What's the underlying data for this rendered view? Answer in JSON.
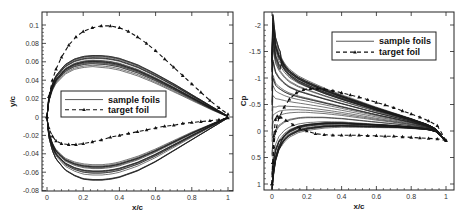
{
  "chart_data": [
    {
      "type": "line",
      "title": "",
      "xlabel": "x/c",
      "ylabel": "y/c",
      "xlim": [
        0,
        1
      ],
      "ylim": [
        -0.08,
        0.114
      ],
      "xticks": [
        "0",
        "0.2",
        "0.4",
        "0.6",
        "0.8",
        "1"
      ],
      "yticks": [
        "0.1",
        "0.08",
        "0.06",
        "0.04",
        "0.02",
        "0",
        "-0.02",
        "-0.04",
        "-0.06",
        "-0.08"
      ],
      "grid": false,
      "legend": {
        "position": "center-left",
        "entries": [
          "sample foils",
          "target foil"
        ]
      },
      "series": [
        {
          "name": "target foil (upper)",
          "style": "dashed-triangle",
          "x": [
            0,
            0.01,
            0.03,
            0.05,
            0.08,
            0.12,
            0.16,
            0.2,
            0.25,
            0.3,
            0.35,
            0.4,
            0.45,
            0.5,
            0.55,
            0.6,
            0.65,
            0.7,
            0.75,
            0.8,
            0.85,
            0.9,
            0.95,
            1.0
          ],
          "y": [
            0,
            0.022,
            0.04,
            0.052,
            0.065,
            0.078,
            0.087,
            0.093,
            0.097,
            0.099,
            0.099,
            0.097,
            0.093,
            0.087,
            0.08,
            0.072,
            0.063,
            0.054,
            0.045,
            0.036,
            0.027,
            0.018,
            0.01,
            0.003
          ]
        },
        {
          "name": "target foil (lower)",
          "style": "dashed-triangle",
          "x": [
            0,
            0.01,
            0.03,
            0.05,
            0.08,
            0.12,
            0.16,
            0.2,
            0.25,
            0.3,
            0.35,
            0.4,
            0.45,
            0.5,
            0.55,
            0.6,
            0.65,
            0.7,
            0.75,
            0.8,
            0.85,
            0.9,
            0.95,
            1.0
          ],
          "y": [
            0,
            -0.012,
            -0.021,
            -0.026,
            -0.029,
            -0.03,
            -0.03,
            -0.029,
            -0.027,
            -0.025,
            -0.022,
            -0.02,
            -0.018,
            -0.016,
            -0.014,
            -0.012,
            -0.01,
            -0.009,
            -0.007,
            -0.006,
            -0.005,
            -0.004,
            -0.003,
            -0.001
          ]
        },
        {
          "name": "sample foils (upper envelope max)",
          "style": "solid",
          "x": [
            0,
            0.01,
            0.03,
            0.05,
            0.1,
            0.15,
            0.2,
            0.25,
            0.3,
            0.35,
            0.4,
            0.5,
            0.6,
            0.7,
            0.8,
            0.9,
            1.0
          ],
          "y": [
            0,
            0.022,
            0.037,
            0.046,
            0.058,
            0.064,
            0.067,
            0.068,
            0.068,
            0.067,
            0.065,
            0.058,
            0.048,
            0.037,
            0.025,
            0.013,
            0.001
          ]
        },
        {
          "name": "sample foils (upper envelope min)",
          "style": "solid",
          "x": [
            0,
            0.01,
            0.03,
            0.05,
            0.1,
            0.15,
            0.2,
            0.25,
            0.3,
            0.35,
            0.4,
            0.5,
            0.6,
            0.7,
            0.8,
            0.9,
            1.0
          ],
          "y": [
            0,
            0.016,
            0.028,
            0.035,
            0.045,
            0.05,
            0.052,
            0.053,
            0.052,
            0.051,
            0.049,
            0.043,
            0.035,
            0.026,
            0.017,
            0.008,
            0.0
          ]
        },
        {
          "name": "sample foils (lower envelope max)",
          "style": "solid",
          "x": [
            0,
            0.01,
            0.03,
            0.05,
            0.1,
            0.15,
            0.2,
            0.25,
            0.3,
            0.35,
            0.4,
            0.5,
            0.6,
            0.7,
            0.8,
            0.9,
            1.0
          ],
          "y": [
            0,
            -0.016,
            -0.028,
            -0.035,
            -0.044,
            -0.048,
            -0.05,
            -0.051,
            -0.051,
            -0.05,
            -0.048,
            -0.042,
            -0.034,
            -0.025,
            -0.016,
            -0.008,
            0.0
          ]
        },
        {
          "name": "sample foils (lower envelope min)",
          "style": "solid",
          "x": [
            0,
            0.01,
            0.03,
            0.05,
            0.1,
            0.15,
            0.2,
            0.25,
            0.3,
            0.35,
            0.4,
            0.5,
            0.6,
            0.7,
            0.8,
            0.9,
            1.0
          ],
          "y": [
            0,
            -0.022,
            -0.037,
            -0.046,
            -0.058,
            -0.064,
            -0.068,
            -0.069,
            -0.069,
            -0.068,
            -0.066,
            -0.059,
            -0.049,
            -0.037,
            -0.025,
            -0.013,
            -0.001
          ]
        }
      ]
    },
    {
      "type": "line",
      "title": "",
      "xlabel": "x/c",
      "ylabel": "Cp",
      "xlim": [
        0,
        1
      ],
      "ylim": [
        1.1,
        -2.25
      ],
      "y_inverted": true,
      "xticks": [
        "0",
        "0.2",
        "0.4",
        "0.6",
        "0.8",
        "1"
      ],
      "yticks": [
        "-2",
        "-1.5",
        "-1",
        "-0.5",
        "0",
        "0.5",
        "1"
      ],
      "grid": false,
      "legend": {
        "position": "upper-right",
        "entries": [
          "sample foils",
          "target foil"
        ]
      },
      "series": [
        {
          "name": "target foil (upper surface)",
          "style": "dashed-triangle",
          "x": [
            0,
            0.005,
            0.01,
            0.02,
            0.04,
            0.07,
            0.1,
            0.14,
            0.18,
            0.22,
            0.26,
            0.3,
            0.35,
            0.4,
            0.45,
            0.5,
            0.55,
            0.6,
            0.65,
            0.7,
            0.75,
            0.8,
            0.85,
            0.9,
            0.95,
            1.0
          ],
          "y": [
            1.0,
            0.6,
            0.3,
            0.0,
            -0.25,
            -0.45,
            -0.6,
            -0.72,
            -0.78,
            -0.8,
            -0.8,
            -0.79,
            -0.76,
            -0.72,
            -0.68,
            -0.64,
            -0.59,
            -0.54,
            -0.49,
            -0.44,
            -0.38,
            -0.32,
            -0.26,
            -0.19,
            -0.1,
            0.18
          ]
        },
        {
          "name": "target foil (lower surface)",
          "style": "dashed-triangle",
          "x": [
            0,
            0.005,
            0.01,
            0.02,
            0.03,
            0.05,
            0.08,
            0.12,
            0.16,
            0.2,
            0.25,
            0.3,
            0.35,
            0.4,
            0.45,
            0.5,
            0.55,
            0.6,
            0.65,
            0.7,
            0.75,
            0.8,
            0.85,
            0.9,
            0.95,
            1.0
          ],
          "y": [
            1.0,
            0.6,
            0.1,
            -0.22,
            -0.28,
            -0.26,
            -0.2,
            -0.12,
            -0.05,
            0.0,
            0.05,
            0.07,
            0.08,
            0.08,
            0.08,
            0.08,
            0.09,
            0.09,
            0.1,
            0.1,
            0.11,
            0.12,
            0.13,
            0.14,
            0.15,
            0.18
          ]
        },
        {
          "name": "sample foils (suction side)",
          "style": "solid",
          "x": [
            0,
            0.005,
            0.01,
            0.02,
            0.04,
            0.07,
            0.1,
            0.15,
            0.2,
            0.3,
            0.4,
            0.5,
            0.6,
            0.7,
            0.8,
            0.9,
            0.95,
            1.0
          ],
          "y": [
            -1.3,
            -2.05,
            -1.85,
            -1.6,
            -1.4,
            -1.22,
            -1.1,
            -0.98,
            -0.9,
            -0.76,
            -0.64,
            -0.53,
            -0.42,
            -0.32,
            -0.22,
            -0.11,
            -0.02,
            0.2
          ]
        },
        {
          "name": "sample foils (pressure side)",
          "style": "solid",
          "x": [
            0,
            0.005,
            0.01,
            0.02,
            0.04,
            0.07,
            0.1,
            0.15,
            0.2,
            0.3,
            0.4,
            0.5,
            0.6,
            0.7,
            0.8,
            0.9,
            0.95,
            1.0
          ],
          "y": [
            1.0,
            0.85,
            0.7,
            0.5,
            0.3,
            0.15,
            0.06,
            -0.02,
            -0.06,
            -0.1,
            -0.11,
            -0.1,
            -0.09,
            -0.08,
            -0.06,
            -0.03,
            0.02,
            0.2
          ]
        }
      ]
    }
  ],
  "plots": [
    {
      "id": "left",
      "frame": {
        "x": 42,
        "y": 12,
        "w": 191,
        "h": 179
      },
      "map": {
        "x0": 47,
        "xs": 181,
        "y0": 117,
        "ys": -920
      },
      "xticks": [
        {
          "v": 0,
          "label": "0"
        },
        {
          "v": 0.2,
          "label": "0.2"
        },
        {
          "v": 0.4,
          "label": "0.4"
        },
        {
          "v": 0.6,
          "label": "0.6"
        },
        {
          "v": 0.8,
          "label": "0.8"
        },
        {
          "v": 1,
          "label": "1"
        }
      ],
      "yticks": [
        {
          "v": 0.1,
          "label": "0.1"
        },
        {
          "v": 0.08,
          "label": "0.08"
        },
        {
          "v": 0.06,
          "label": "0.06"
        },
        {
          "v": 0.04,
          "label": "0.04"
        },
        {
          "v": 0.02,
          "label": "0.02"
        },
        {
          "v": 0,
          "label": "0"
        },
        {
          "v": -0.02,
          "label": "-0.02"
        },
        {
          "v": -0.04,
          "label": "-0.04"
        },
        {
          "v": -0.06,
          "label": "-0.06"
        },
        {
          "v": -0.08,
          "label": "-0.08"
        }
      ],
      "xlabel": "x/c",
      "ylabel": "y/c",
      "legend": {
        "x": 61,
        "y": 91,
        "w": 105,
        "h": 26,
        "sample_label": "sample foils",
        "target_label": "target foil"
      }
    },
    {
      "id": "right",
      "frame": {
        "x": 264,
        "y": 12,
        "w": 190,
        "h": 178
      },
      "map": {
        "x0": 272,
        "xs": 174,
        "y0": 131,
        "ys": 53
      },
      "xticks": [
        {
          "v": 0,
          "label": "0"
        },
        {
          "v": 0.2,
          "label": "0.2"
        },
        {
          "v": 0.4,
          "label": "0.4"
        },
        {
          "v": 0.6,
          "label": "0.6"
        },
        {
          "v": 0.8,
          "label": "0.8"
        },
        {
          "v": 1,
          "label": "1"
        }
      ],
      "yticks": [
        {
          "v": -2,
          "label": "-2"
        },
        {
          "v": -1.5,
          "label": "-1.5"
        },
        {
          "v": -1,
          "label": "-1"
        },
        {
          "v": -0.5,
          "label": "-0.5"
        },
        {
          "v": 0,
          "label": "0"
        },
        {
          "v": 0.5,
          "label": "0.5"
        },
        {
          "v": 1,
          "label": "1"
        }
      ],
      "xlabel": "x/c",
      "ylabel": "Cp",
      "legend": {
        "x": 332,
        "y": 32,
        "w": 104,
        "h": 28,
        "sample_label": "sample foils",
        "target_label": "target foil"
      }
    }
  ],
  "colors": {
    "line": "#111111",
    "frame": "#222222",
    "background": "#ffffff",
    "sample": "#1a1a1a"
  }
}
